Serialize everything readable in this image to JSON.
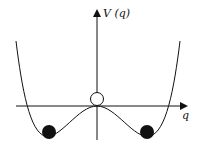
{
  "diagram": {
    "y_axis_label": "V (q)",
    "x_axis_label": "q",
    "curve": "double-well potential V(q)",
    "balls": [
      {
        "name": "left-minimum-ball",
        "filled": true
      },
      {
        "name": "right-minimum-ball",
        "filled": true
      },
      {
        "name": "unstable-maximum-ball",
        "filled": false
      }
    ]
  }
}
